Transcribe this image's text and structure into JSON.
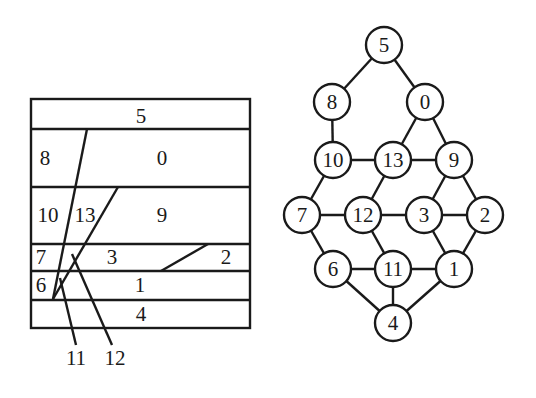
{
  "left_diagram": {
    "name": "floorplan-partition",
    "box": {
      "x": 31,
      "y": 99,
      "width": 219,
      "height": 229
    },
    "row_dividers_y": [
      129,
      187,
      244,
      271,
      300
    ],
    "labels": [
      {
        "text": "5",
        "x": 141,
        "y": 123
      },
      {
        "text": "8",
        "x": 45,
        "y": 165
      },
      {
        "text": "0",
        "x": 162,
        "y": 165
      },
      {
        "text": "10",
        "x": 48,
        "y": 222
      },
      {
        "text": "13",
        "x": 85,
        "y": 222
      },
      {
        "text": "9",
        "x": 162,
        "y": 222
      },
      {
        "text": "7",
        "x": 41,
        "y": 264
      },
      {
        "text": "3",
        "x": 112,
        "y": 264
      },
      {
        "text": "2",
        "x": 226,
        "y": 264
      },
      {
        "text": "6",
        "x": 41,
        "y": 292
      },
      {
        "text": "1",
        "x": 140,
        "y": 292
      },
      {
        "text": "4",
        "x": 141,
        "y": 321
      },
      {
        "text": "11",
        "x": 76,
        "y": 365
      },
      {
        "text": "12",
        "x": 115,
        "y": 365
      }
    ],
    "lines": [
      {
        "x1": 87,
        "y1": 129,
        "x2": 53,
        "y2": 299
      },
      {
        "x1": 118,
        "y1": 187,
        "x2": 53,
        "y2": 299
      },
      {
        "x1": 208,
        "y1": 244,
        "x2": 161,
        "y2": 271
      },
      {
        "x1": 60,
        "y1": 278,
        "x2": 76,
        "y2": 345
      },
      {
        "x1": 72,
        "y1": 254,
        "x2": 112,
        "y2": 345
      }
    ]
  },
  "graph": {
    "name": "adjacency-graph",
    "node_radius": 18,
    "nodes": [
      {
        "id": "5",
        "x": 384,
        "y": 45
      },
      {
        "id": "8",
        "x": 332,
        "y": 102
      },
      {
        "id": "0",
        "x": 425,
        "y": 102
      },
      {
        "id": "10",
        "x": 333,
        "y": 160
      },
      {
        "id": "13",
        "x": 393,
        "y": 160
      },
      {
        "id": "9",
        "x": 454,
        "y": 160
      },
      {
        "id": "7",
        "x": 302,
        "y": 215
      },
      {
        "id": "12",
        "x": 363,
        "y": 215
      },
      {
        "id": "3",
        "x": 424,
        "y": 215
      },
      {
        "id": "2",
        "x": 485,
        "y": 215
      },
      {
        "id": "6",
        "x": 333,
        "y": 269
      },
      {
        "id": "11",
        "x": 393,
        "y": 269
      },
      {
        "id": "1",
        "x": 454,
        "y": 269
      },
      {
        "id": "4",
        "x": 393,
        "y": 323
      }
    ],
    "edges": [
      [
        "5",
        "8"
      ],
      [
        "5",
        "0"
      ],
      [
        "8",
        "10"
      ],
      [
        "0",
        "13"
      ],
      [
        "0",
        "9"
      ],
      [
        "10",
        "13"
      ],
      [
        "13",
        "9"
      ],
      [
        "10",
        "7"
      ],
      [
        "13",
        "12"
      ],
      [
        "9",
        "3"
      ],
      [
        "9",
        "2"
      ],
      [
        "7",
        "12"
      ],
      [
        "12",
        "3"
      ],
      [
        "3",
        "2"
      ],
      [
        "7",
        "6"
      ],
      [
        "12",
        "11"
      ],
      [
        "3",
        "1"
      ],
      [
        "2",
        "1"
      ],
      [
        "6",
        "11"
      ],
      [
        "11",
        "1"
      ],
      [
        "6",
        "4"
      ],
      [
        "11",
        "4"
      ],
      [
        "1",
        "4"
      ]
    ]
  }
}
